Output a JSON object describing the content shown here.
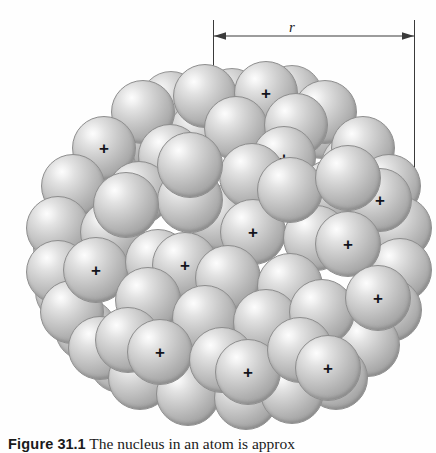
{
  "figure": {
    "caption_label": "Figure",
    "caption_number": "31.1",
    "caption_text": "The nucleus in an atom is approx",
    "dimension_label": "r",
    "background_color": "#fefefe",
    "sphere_color": "#bdbdbd",
    "sphere_highlight_color": "#fdfdfd",
    "sphere_edge_color": "#8e8e8e",
    "annotation_color": "#3a3a3a",
    "proton_mark": "+",
    "proton_mark_color": "#14141c"
  },
  "chart_data": {
    "type": "scatter",
    "xlabel": "",
    "ylabel": "",
    "annotations": [
      "r"
    ],
    "nucleon_radius": 31,
    "proton_count": 15,
    "nucleon_count": 76,
    "nucleons": [
      {
        "x": 171,
        "y": 102,
        "r": 31,
        "layer": "back",
        "proton": false
      },
      {
        "x": 232,
        "y": 99,
        "r": 31,
        "layer": "back",
        "proton": false
      },
      {
        "x": 292,
        "y": 96,
        "r": 31,
        "layer": "back",
        "proton": false
      },
      {
        "x": 138,
        "y": 135,
        "r": 31,
        "layer": "back",
        "proton": false
      },
      {
        "x": 200,
        "y": 132,
        "r": 31,
        "layer": "back",
        "proton": false
      },
      {
        "x": 262,
        "y": 130,
        "r": 31,
        "layer": "back",
        "proton": false
      },
      {
        "x": 322,
        "y": 128,
        "r": 31,
        "layer": "back",
        "proton": false
      },
      {
        "x": 106,
        "y": 170,
        "r": 31,
        "layer": "back",
        "proton": false
      },
      {
        "x": 168,
        "y": 168,
        "r": 31,
        "layer": "back",
        "proton": false
      },
      {
        "x": 352,
        "y": 165,
        "r": 31,
        "layer": "back",
        "proton": false
      },
      {
        "x": 78,
        "y": 208,
        "r": 31,
        "layer": "back",
        "proton": false
      },
      {
        "x": 380,
        "y": 200,
        "r": 31,
        "layer": "back",
        "proton": false
      },
      {
        "x": 64,
        "y": 248,
        "r": 31,
        "layer": "back",
        "proton": false
      },
      {
        "x": 390,
        "y": 243,
        "r": 31,
        "layer": "back",
        "proton": false
      },
      {
        "x": 66,
        "y": 292,
        "r": 31,
        "layer": "back",
        "proton": false
      },
      {
        "x": 384,
        "y": 288,
        "r": 31,
        "layer": "back",
        "proton": false
      },
      {
        "x": 86,
        "y": 330,
        "r": 31,
        "layer": "back",
        "proton": false
      },
      {
        "x": 360,
        "y": 328,
        "r": 31,
        "layer": "back",
        "proton": false
      },
      {
        "x": 120,
        "y": 362,
        "r": 31,
        "layer": "back",
        "proton": false
      },
      {
        "x": 330,
        "y": 360,
        "r": 31,
        "layer": "back",
        "proton": false
      },
      {
        "x": 205,
        "y": 96,
        "r": 32,
        "layer": "mid",
        "proton": false
      },
      {
        "x": 266,
        "y": 93,
        "r": 32,
        "layer": "mid",
        "proton": true
      },
      {
        "x": 143,
        "y": 112,
        "r": 32,
        "layer": "mid",
        "proton": false
      },
      {
        "x": 325,
        "y": 112,
        "r": 32,
        "layer": "mid",
        "proton": false
      },
      {
        "x": 104,
        "y": 148,
        "r": 32,
        "layer": "mid",
        "proton": true
      },
      {
        "x": 236,
        "y": 128,
        "r": 32,
        "layer": "mid",
        "proton": false
      },
      {
        "x": 296,
        "y": 125,
        "r": 32,
        "layer": "mid",
        "proton": false
      },
      {
        "x": 363,
        "y": 148,
        "r": 32,
        "layer": "mid",
        "proton": false
      },
      {
        "x": 73,
        "y": 186,
        "r": 32,
        "layer": "mid",
        "proton": false
      },
      {
        "x": 170,
        "y": 156,
        "r": 32,
        "layer": "mid",
        "proton": true
      },
      {
        "x": 389,
        "y": 186,
        "r": 32,
        "layer": "mid",
        "proton": false
      },
      {
        "x": 284,
        "y": 158,
        "r": 32,
        "layer": "mid",
        "proton": true
      },
      {
        "x": 58,
        "y": 228,
        "r": 32,
        "layer": "mid",
        "proton": false
      },
      {
        "x": 400,
        "y": 228,
        "r": 32,
        "layer": "mid",
        "proton": false
      },
      {
        "x": 139,
        "y": 193,
        "r": 32,
        "layer": "mid",
        "proton": false
      },
      {
        "x": 330,
        "y": 192,
        "r": 32,
        "layer": "mid",
        "proton": false
      },
      {
        "x": 58,
        "y": 272,
        "r": 32,
        "layer": "mid",
        "proton": false
      },
      {
        "x": 400,
        "y": 270,
        "r": 32,
        "layer": "mid",
        "proton": false
      },
      {
        "x": 112,
        "y": 232,
        "r": 32,
        "layer": "mid",
        "proton": false
      },
      {
        "x": 380,
        "y": 200,
        "r": 32,
        "layer": "mid",
        "proton": true
      },
      {
        "x": 72,
        "y": 312,
        "r": 32,
        "layer": "mid",
        "proton": false
      },
      {
        "x": 390,
        "y": 310,
        "r": 32,
        "layer": "mid",
        "proton": false
      },
      {
        "x": 100,
        "y": 348,
        "r": 32,
        "layer": "mid",
        "proton": false
      },
      {
        "x": 368,
        "y": 345,
        "r": 32,
        "layer": "mid",
        "proton": false
      },
      {
        "x": 140,
        "y": 378,
        "r": 32,
        "layer": "mid",
        "proton": false
      },
      {
        "x": 336,
        "y": 378,
        "r": 32,
        "layer": "mid",
        "proton": false
      },
      {
        "x": 188,
        "y": 394,
        "r": 32,
        "layer": "mid",
        "proton": false
      },
      {
        "x": 246,
        "y": 398,
        "r": 32,
        "layer": "mid",
        "proton": false
      },
      {
        "x": 292,
        "y": 392,
        "r": 32,
        "layer": "mid",
        "proton": false
      },
      {
        "x": 96,
        "y": 270,
        "r": 33,
        "layer": "front",
        "proton": true
      },
      {
        "x": 158,
        "y": 262,
        "r": 33,
        "layer": "front",
        "proton": false
      },
      {
        "x": 222,
        "y": 218,
        "r": 33,
        "layer": "front",
        "proton": false
      },
      {
        "x": 190,
        "y": 200,
        "r": 33,
        "layer": "front",
        "proton": false
      },
      {
        "x": 252,
        "y": 176,
        "r": 33,
        "layer": "front",
        "proton": false
      },
      {
        "x": 190,
        "y": 165,
        "r": 33,
        "layer": "front",
        "proton": false
      },
      {
        "x": 253,
        "y": 232,
        "r": 33,
        "layer": "front",
        "proton": true
      },
      {
        "x": 316,
        "y": 238,
        "r": 33,
        "layer": "front",
        "proton": false
      },
      {
        "x": 348,
        "y": 244,
        "r": 33,
        "layer": "front",
        "proton": true
      },
      {
        "x": 185,
        "y": 265,
        "r": 33,
        "layer": "front",
        "proton": true
      },
      {
        "x": 228,
        "y": 278,
        "r": 33,
        "layer": "front",
        "proton": false
      },
      {
        "x": 290,
        "y": 286,
        "r": 33,
        "layer": "front",
        "proton": false
      },
      {
        "x": 148,
        "y": 300,
        "r": 33,
        "layer": "front",
        "proton": false
      },
      {
        "x": 205,
        "y": 318,
        "r": 33,
        "layer": "front",
        "proton": false
      },
      {
        "x": 266,
        "y": 322,
        "r": 33,
        "layer": "front",
        "proton": false
      },
      {
        "x": 322,
        "y": 312,
        "r": 33,
        "layer": "front",
        "proton": false
      },
      {
        "x": 378,
        "y": 298,
        "r": 33,
        "layer": "front",
        "proton": true
      },
      {
        "x": 128,
        "y": 340,
        "r": 33,
        "layer": "front",
        "proton": false
      },
      {
        "x": 160,
        "y": 352,
        "r": 33,
        "layer": "front",
        "proton": true
      },
      {
        "x": 222,
        "y": 360,
        "r": 33,
        "layer": "front",
        "proton": false
      },
      {
        "x": 248,
        "y": 372,
        "r": 33,
        "layer": "front",
        "proton": true
      },
      {
        "x": 300,
        "y": 350,
        "r": 33,
        "layer": "front",
        "proton": false
      },
      {
        "x": 328,
        "y": 368,
        "r": 33,
        "layer": "front",
        "proton": true
      },
      {
        "x": 290,
        "y": 190,
        "r": 33,
        "layer": "front",
        "proton": false
      },
      {
        "x": 348,
        "y": 178,
        "r": 33,
        "layer": "front",
        "proton": false
      },
      {
        "x": 126,
        "y": 205,
        "r": 33,
        "layer": "front",
        "proton": false
      }
    ]
  }
}
